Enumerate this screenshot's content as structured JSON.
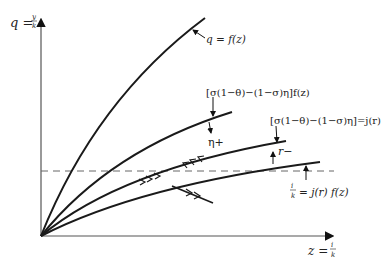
{
  "axes": {
    "y_label": "q = y/k",
    "y_label_parts": {
      "lhs": "q =",
      "num": "y",
      "den": "k"
    },
    "x_label": "z = i/k",
    "x_label_parts": {
      "lhs": "z =",
      "num": "i",
      "den": "k"
    }
  },
  "curves": [
    {
      "id": "q-f-z",
      "label": "q = f(z)"
    },
    {
      "id": "sigma-f-z",
      "label": "[σ(1−θ)−(1−σ)η]f(z)"
    },
    {
      "id": "sigma-j-r",
      "label": "[σ(1−θ)−(1−σ)η]=j(r)"
    },
    {
      "id": "i-k-j-r-f-z",
      "label": "i/k = j(r) f(z)",
      "label_parts": {
        "num": "i",
        "den": "k",
        "rhs": "= j(r) f(z)"
      }
    }
  ],
  "annotations": {
    "eta_plus": "η+",
    "r_minus": "r−"
  },
  "colors": {
    "line": "#1a1a1a",
    "axis": "#555555",
    "dashed": "#666666",
    "text": "#222222"
  }
}
